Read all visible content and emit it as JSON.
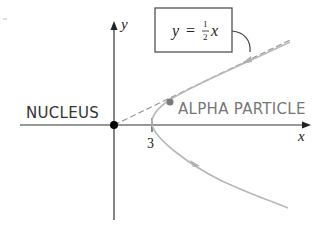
{
  "diagram": {
    "labels": {
      "y_axis": "y",
      "x_axis": "x",
      "nucleus": "NUCLEUS",
      "alpha_particle": "ALPHA PARTICLE",
      "tick_3": "3",
      "equation_lhs": "y",
      "equation_eq": "=",
      "equation_num": "1",
      "equation_den": "2",
      "equation_var": "x"
    },
    "colors": {
      "axis": "#333333",
      "text": "#222222",
      "label_gray": "#777777",
      "curve": "#b8b8b8",
      "asymptote": "#9a9a9a",
      "particle": "#7a7a7a",
      "nucleus": "#000000",
      "box_border": "#444444"
    },
    "elements": {
      "asymptote_equation": "y = 1/2 x",
      "vertex_x": 3
    }
  }
}
